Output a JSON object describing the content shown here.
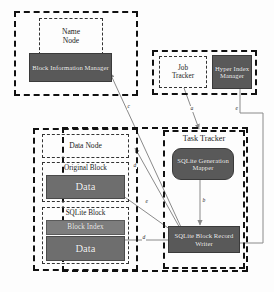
{
  "figure": {
    "type": "architecture-block-diagram",
    "background": "#fdfdfd",
    "palette": {
      "box_fill_dark": "#595959",
      "box_fill_mid": "#6e6e6e",
      "box_fill_light": "#7d7d7d",
      "box_text": "#f2f2f2",
      "outline": "#111111",
      "link": "#8a8a8a"
    }
  },
  "clusters": {
    "name_node_cluster": {
      "name": "name-node-cluster",
      "children": {
        "name_node": "Name\nNode",
        "block_information_manager": "Block Information\nManager"
      }
    },
    "job_cluster": {
      "name": "job-tracker-cluster",
      "children": {
        "job_tracker": "Job\nTracker",
        "hyper_index_manager": "Hyper\nIndex\nManager"
      }
    },
    "bottom_cluster": {
      "name": "datanode-tasktracker-cluster",
      "data_node_group": {
        "data_node": "Data Node",
        "original_block": {
          "title": "Original Block",
          "data": "Data"
        },
        "sqlite_block": {
          "title": "SQLite Block",
          "block_index": "Block Index",
          "data": "Data"
        }
      },
      "task_tracker_group": {
        "title": "Task Tracker",
        "sqlite_generation_mapper": "SQLite\nGeneration\nMapper",
        "sqlite_block_record_writer": "SQLite Block\nRecord Writer"
      }
    }
  },
  "edges": [
    {
      "id": "a",
      "label": "a",
      "from": "Job Tracker",
      "to": "SQLite Generation Mapper"
    },
    {
      "id": "b",
      "label": "b",
      "from": "SQLite Generation Mapper",
      "to": "SQLite Block Record Writer"
    },
    {
      "id": "c",
      "label": "c",
      "from": "SQLite Block Record Writer",
      "to": "Block Information Manager"
    },
    {
      "id": "d1",
      "label": "d",
      "from": "SQLite Block Record Writer",
      "to": "Data Node"
    },
    {
      "id": "e1",
      "label": "e",
      "from": "Original Block Data",
      "to": "SQLite Block Record Writer"
    },
    {
      "id": "d2",
      "label": "d",
      "from": "SQLite Block Record Writer",
      "to": "Block Index"
    },
    {
      "id": "e2",
      "label": "e",
      "from": "Hyper Index Manager",
      "to": "SQLite Block Record Writer"
    }
  ]
}
